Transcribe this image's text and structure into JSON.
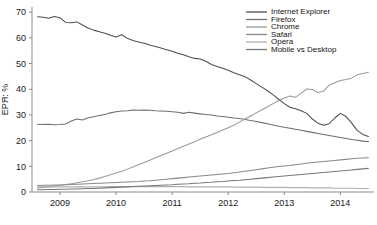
{
  "chart_data": {
    "type": "line",
    "title": "",
    "xlabel": "",
    "ylabel": "EPЯ: %",
    "xlim": [
      2008.5,
      2014.6
    ],
    "ylim": [
      0,
      72
    ],
    "grid": false,
    "legend_position": "top-right",
    "xticks": [
      "2009",
      "2010",
      "2011",
      "2012",
      "2013",
      "2014"
    ],
    "xtick_values": [
      2009,
      2010,
      2011,
      2012,
      2013,
      2014
    ],
    "yticks": [
      "0",
      "10",
      "20",
      "30",
      "40",
      "50",
      "60",
      "70"
    ],
    "ytick_values": [
      0,
      10,
      20,
      30,
      40,
      50,
      60,
      70
    ],
    "x": [
      2008.6,
      2008.7,
      2008.8,
      2008.9,
      2009.0,
      2009.1,
      2009.2,
      2009.3,
      2009.4,
      2009.5,
      2009.6,
      2009.7,
      2009.8,
      2009.9,
      2010.0,
      2010.1,
      2010.2,
      2010.3,
      2010.4,
      2010.5,
      2010.6,
      2010.7,
      2010.8,
      2010.9,
      2011.0,
      2011.1,
      2011.2,
      2011.3,
      2011.4,
      2011.5,
      2011.6,
      2011.7,
      2011.8,
      2011.9,
      2012.0,
      2012.1,
      2012.2,
      2012.3,
      2012.4,
      2012.5,
      2012.6,
      2012.7,
      2012.8,
      2012.9,
      2013.0,
      2013.1,
      2013.2,
      2013.3,
      2013.4,
      2013.5,
      2013.6,
      2013.7,
      2013.8,
      2013.9,
      2014.0,
      2014.1,
      2014.2,
      2014.3,
      2014.4,
      2014.5
    ],
    "series": [
      {
        "name": "Internet Explorer",
        "color": "#4d4d4d",
        "values": [
          68.2,
          68.0,
          67.6,
          68.3,
          67.8,
          66.0,
          65.9,
          66.2,
          65.0,
          63.8,
          63.0,
          62.4,
          61.8,
          61.0,
          60.3,
          61.2,
          59.8,
          59.0,
          58.4,
          57.9,
          57.2,
          56.6,
          56.0,
          55.4,
          54.8,
          54.0,
          53.4,
          52.6,
          52.0,
          51.8,
          50.9,
          49.6,
          48.8,
          48.2,
          47.4,
          46.4,
          45.6,
          44.9,
          43.6,
          42.2,
          40.8,
          39.4,
          37.8,
          36.1,
          34.4,
          33.0,
          32.4,
          31.6,
          30.6,
          28.4,
          26.8,
          26.0,
          26.6,
          28.8,
          30.6,
          29.4,
          26.9,
          24.0,
          22.4,
          21.6
        ]
      },
      {
        "name": "Firefox",
        "color": "#6e6e6e",
        "values": [
          26.4,
          26.3,
          26.4,
          26.2,
          26.3,
          26.5,
          27.6,
          28.4,
          28.0,
          28.9,
          29.3,
          29.8,
          30.2,
          30.8,
          31.2,
          31.5,
          31.6,
          31.9,
          31.8,
          31.9,
          31.8,
          31.6,
          31.5,
          31.4,
          31.2,
          31.0,
          30.6,
          31.0,
          30.7,
          30.4,
          30.2,
          30.0,
          29.6,
          29.4,
          29.1,
          28.8,
          28.6,
          28.2,
          27.8,
          27.4,
          27.0,
          26.6,
          26.1,
          25.6,
          25.2,
          24.8,
          24.4,
          24.0,
          23.6,
          23.2,
          22.8,
          22.4,
          22.0,
          21.6,
          21.2,
          20.8,
          20.4,
          20.1,
          19.8,
          19.6
        ]
      },
      {
        "name": "Chrome",
        "color": "#9a9a9a",
        "values": [
          1.6,
          1.8,
          2.0,
          2.3,
          2.6,
          2.9,
          3.2,
          3.6,
          4.0,
          4.4,
          4.9,
          5.4,
          6.0,
          6.7,
          7.4,
          8.1,
          8.9,
          9.7,
          10.6,
          11.5,
          12.4,
          13.3,
          14.2,
          15.1,
          16.0,
          16.9,
          17.8,
          18.7,
          19.6,
          20.5,
          21.4,
          22.3,
          23.2,
          24.1,
          25.0,
          26.0,
          27.2,
          28.4,
          29.6,
          30.8,
          32.0,
          33.2,
          34.4,
          35.6,
          36.6,
          37.4,
          36.9,
          38.4,
          40.1,
          39.9,
          38.7,
          39.2,
          41.6,
          42.5,
          43.4,
          43.8,
          44.3,
          45.6,
          46.1,
          46.6
        ]
      },
      {
        "name": "Safari",
        "color": "#8a8a8a",
        "values": [
          2.5,
          2.6,
          2.6,
          2.7,
          2.7,
          2.8,
          2.9,
          3.0,
          3.1,
          3.2,
          3.3,
          3.4,
          3.5,
          3.6,
          3.7,
          3.8,
          3.9,
          4.0,
          4.1,
          4.3,
          4.4,
          4.6,
          4.8,
          5.0,
          5.2,
          5.4,
          5.6,
          5.8,
          6.0,
          6.2,
          6.4,
          6.6,
          6.8,
          7.0,
          7.2,
          7.5,
          7.8,
          8.1,
          8.4,
          8.7,
          9.0,
          9.3,
          9.6,
          9.9,
          10.1,
          10.3,
          10.6,
          10.9,
          11.2,
          11.5,
          11.7,
          11.9,
          12.1,
          12.3,
          12.5,
          12.7,
          12.9,
          13.1,
          13.2,
          13.3
        ]
      },
      {
        "name": "Opera",
        "color": "#b0b0b0",
        "values": [
          2.0,
          2.0,
          2.0,
          2.0,
          2.0,
          2.0,
          2.0,
          2.0,
          2.0,
          2.0,
          2.0,
          2.0,
          2.0,
          2.1,
          2.1,
          2.1,
          2.1,
          2.1,
          2.1,
          2.1,
          2.1,
          2.1,
          2.1,
          2.1,
          2.1,
          2.1,
          2.1,
          2.0,
          2.0,
          2.0,
          2.0,
          2.0,
          2.0,
          2.0,
          2.0,
          1.9,
          1.9,
          1.9,
          1.9,
          1.9,
          1.8,
          1.8,
          1.8,
          1.8,
          1.8,
          1.7,
          1.7,
          1.7,
          1.7,
          1.6,
          1.6,
          1.6,
          1.6,
          1.5,
          1.5,
          1.5,
          1.5,
          1.4,
          1.4,
          1.4
        ]
      },
      {
        "name": "Mobile vs Desktop",
        "color": "#787878",
        "values": [
          0.9,
          0.9,
          1.0,
          1.0,
          1.1,
          1.1,
          1.2,
          1.2,
          1.3,
          1.4,
          1.4,
          1.5,
          1.6,
          1.7,
          1.8,
          1.9,
          2.0,
          2.1,
          2.2,
          2.3,
          2.4,
          2.5,
          2.6,
          2.7,
          2.8,
          3.0,
          3.1,
          3.2,
          3.4,
          3.5,
          3.7,
          3.8,
          4.0,
          4.1,
          4.3,
          4.5,
          4.6,
          4.8,
          5.0,
          5.2,
          5.4,
          5.6,
          5.8,
          6.0,
          6.2,
          6.4,
          6.6,
          6.8,
          7.0,
          7.2,
          7.4,
          7.6,
          7.8,
          8.0,
          8.2,
          8.4,
          8.6,
          8.8,
          9.0,
          9.2
        ]
      }
    ]
  },
  "legend": {
    "items": [
      {
        "label": "Internet Explorer"
      },
      {
        "label": "Firefox"
      },
      {
        "label": "Chrome"
      },
      {
        "label": "Safari"
      },
      {
        "label": "Opera"
      },
      {
        "label": "Mobile vs Desktop"
      }
    ]
  }
}
